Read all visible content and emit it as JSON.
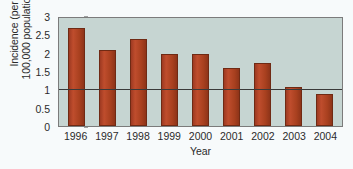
{
  "chart_data": {
    "type": "bar",
    "title": "",
    "xlabel": "Year",
    "ylabel": "Incidence (per 100,000 population)",
    "ylabel_lines": [
      "Incidence (per",
      "100,000 population)"
    ],
    "categories": [
      "1996",
      "1997",
      "1998",
      "1999",
      "2000",
      "2001",
      "2002",
      "2003",
      "2004"
    ],
    "values": [
      2.72,
      2.12,
      2.43,
      2.01,
      2.01,
      1.61,
      1.74,
      1.08,
      0.9
    ],
    "yticks": [
      "0",
      "0.5",
      "1",
      "1.5",
      "2",
      "2.5",
      "3"
    ],
    "ytick_values": [
      0,
      0.5,
      1,
      1.5,
      2,
      2.5,
      3
    ],
    "ylim": [
      0,
      3
    ],
    "gridlines": [
      1
    ],
    "grid": "single-horizontal-at-1",
    "legend": "none",
    "series_name": "Incidence",
    "colors": {
      "bar": "#b4442a",
      "bar_outline": "#6f2a14",
      "plot_background": "#c6d5d2",
      "page_background": "#f7fafb",
      "axis": "#7b7b7b",
      "gridline": "#3a3a3a",
      "text": "#2b2b2b"
    }
  }
}
